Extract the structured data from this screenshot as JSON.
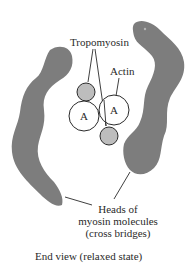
{
  "diagram": {
    "title": "End view (relaxed state)",
    "labels": {
      "tropomyosin": "Tropomyosin",
      "actin": "Actin",
      "myosin_heads": [
        "Heads of",
        "myosin molecules",
        "(cross bridges)"
      ]
    },
    "actin_circle_letter": "A",
    "colors": {
      "myosin_head": "#7d7d7d",
      "tropomyosin": "#bdbdbd",
      "actin_fill": "#ffffff",
      "outline": "#2a2a2a"
    },
    "components": [
      {
        "name": "myosin-head-left",
        "type": "blob"
      },
      {
        "name": "myosin-head-right",
        "type": "blob"
      },
      {
        "name": "actin-left",
        "type": "circle",
        "letter": "A"
      },
      {
        "name": "actin-right",
        "type": "circle",
        "letter": "A"
      },
      {
        "name": "tropomyosin-top",
        "type": "circle"
      },
      {
        "name": "tropomyosin-bottom",
        "type": "circle"
      }
    ]
  }
}
